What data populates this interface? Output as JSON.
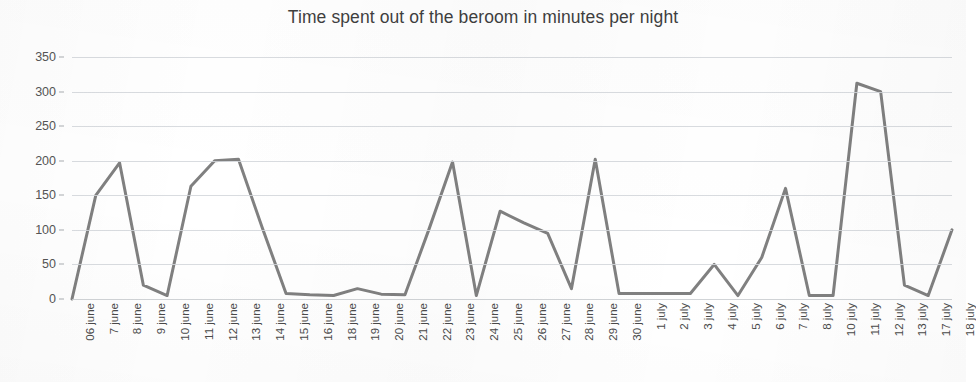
{
  "chart_data": {
    "type": "line",
    "title": "Time spent out of the beroom in minutes per night",
    "xlabel": "",
    "ylabel": "",
    "ylim": [
      0,
      350
    ],
    "ytick_step": 50,
    "yticks": [
      350,
      300,
      250,
      200,
      150,
      100,
      50,
      0
    ],
    "grid": true,
    "legend": "none",
    "line_color": "#808080",
    "line_width": 3,
    "markers": false,
    "categories": [
      "06 june",
      "7 june",
      "8 june",
      "9 june",
      "10 june",
      "11 june",
      "12 june",
      "13 june",
      "14 june",
      "15 june",
      "16 june",
      "18 june",
      "19 june",
      "20 june",
      "21 june",
      "22 june",
      "23 june",
      "24 june",
      "25 june",
      "26 june",
      "27 june",
      "28 june",
      "29 june",
      "30 june",
      "1 july",
      "2 july",
      "3 july",
      "4 july",
      "5 july",
      "6 july",
      "7 july",
      "8 july",
      "10 july",
      "11 july",
      "12 july",
      "13 july",
      "17 july",
      "18 july"
    ],
    "values": [
      0,
      150,
      197,
      20,
      5,
      163,
      200,
      202,
      103,
      8,
      6,
      5,
      15,
      7,
      6,
      100,
      198,
      5,
      127,
      110,
      95,
      15,
      202,
      8,
      8,
      8,
      8,
      50,
      5,
      60,
      160,
      5,
      5,
      312,
      300,
      20,
      5,
      100
    ],
    "ylabel_format": "integer"
  },
  "axis": {
    "y_tick_labels": [
      "350",
      "300",
      "250",
      "200",
      "150",
      "100",
      "50",
      "0"
    ]
  }
}
